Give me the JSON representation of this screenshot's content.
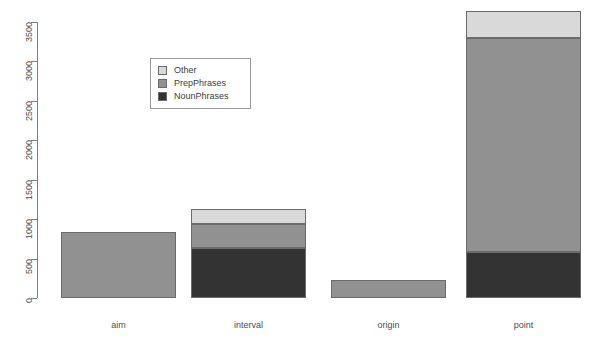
{
  "chart_data": {
    "type": "bar",
    "title": "",
    "xlabel": "",
    "ylabel": "",
    "stacked": true,
    "grid": false,
    "legend_position": "top-left-inset",
    "categories": [
      "aim",
      "interval",
      "origin",
      "point"
    ],
    "ylim": [
      0,
      3500
    ],
    "yticks": [
      0,
      500,
      1000,
      1500,
      2000,
      2500,
      3000,
      3500
    ],
    "ytick_labels": [
      "0",
      "500",
      "1000",
      "1500",
      "2000",
      "2500",
      "3000",
      "3500"
    ],
    "series": [
      {
        "name": "NounPhrases",
        "color": "#333333",
        "values": [
          0,
          634,
          0,
          583
        ]
      },
      {
        "name": "PrepPhrases",
        "color": "#919191",
        "values": [
          837,
          305,
          228,
          2713
        ]
      },
      {
        "name": "Other",
        "color": "#d9d9d9",
        "values": [
          0,
          190,
          0,
          343
        ]
      }
    ],
    "totals": [
      837,
      1129,
      228,
      3639
    ]
  },
  "legend": {
    "entries": [
      {
        "label": "Other",
        "color": "#d9d9d9"
      },
      {
        "label": "PrepPhrases",
        "color": "#919191"
      },
      {
        "label": "NounPhrases",
        "color": "#333333"
      }
    ]
  },
  "axis": {
    "tick_color": "#7f7f7f",
    "label_color": "#4d4d4d"
  },
  "geometry": {
    "baseline_y": 298,
    "top_y": 22,
    "bar_width": 115,
    "bar_left_positions": [
      61,
      191,
      331,
      466
    ]
  }
}
